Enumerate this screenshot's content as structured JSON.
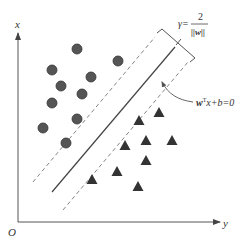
{
  "diagram": {
    "axes": {
      "vertical_label": "x",
      "horizontal_label": "y",
      "origin_label": "O",
      "origin": [
        18,
        222
      ],
      "vertical_end": [
        18,
        33
      ],
      "horizontal_end": [
        220,
        222
      ],
      "color": "#555555"
    },
    "margin_label": {
      "gamma": "γ=",
      "numerator": "2",
      "denominator": "||w||"
    },
    "hyperplane_label": {
      "w": "w",
      "sup": "T",
      "rest": "x+b=0"
    },
    "lines": {
      "decision_boundary": {
        "x1": 52,
        "y1": 192,
        "x2": 175,
        "y2": 47,
        "style": "solid"
      },
      "upper_margin": {
        "x1": 33,
        "y1": 182,
        "x2": 155,
        "y2": 37,
        "style": "dashed"
      },
      "lower_margin": {
        "x1": 63,
        "y1": 210,
        "x2": 188,
        "y2": 62,
        "style": "dashed"
      }
    },
    "class_circles": {
      "color": "#555555",
      "stroke": "#333333",
      "radius": 5,
      "points": [
        [
          77,
          49
        ],
        [
          118,
          61
        ],
        [
          52,
          70
        ],
        [
          91,
          77
        ],
        [
          61,
          86
        ],
        [
          82,
          94
        ],
        [
          52,
          103
        ],
        [
          77,
          119
        ],
        [
          43,
          128
        ],
        [
          66,
          143
        ]
      ]
    },
    "class_triangles": {
      "color": "#333333",
      "size": 11,
      "points": [
        [
          159,
          112
        ],
        [
          139,
          120
        ],
        [
          125,
          145
        ],
        [
          146,
          140
        ],
        [
          172,
          140
        ],
        [
          146,
          160
        ],
        [
          117,
          171
        ],
        [
          92,
          179
        ],
        [
          138,
          186
        ]
      ]
    }
  }
}
